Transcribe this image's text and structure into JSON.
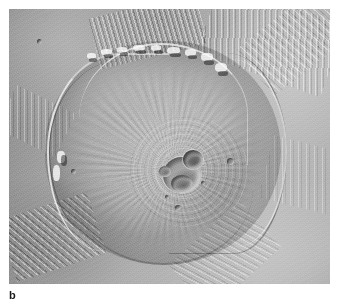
{
  "figure": {
    "panel_label": "b",
    "image_type": "grayscale orbital photograph",
    "colors": {
      "page_background": "#ffffff",
      "plains_mid_gray": "#b8b8b8",
      "flank_gray": "#a0a0a0",
      "shadow_dark": "#5c5c5c",
      "scarp_highlight": "#e8e8e8",
      "caption_text": "#1a1a1a"
    },
    "features": [
      {
        "name": "summit-caldera-complex",
        "description": "overlapping nested collapse craters at the summit"
      },
      {
        "name": "basal-escarpment",
        "description": "bright sunlit cliff ringing the western and northern base"
      },
      {
        "name": "radial-flank-ridges",
        "description": "fine radial lava flow fabric on the shield flanks"
      },
      {
        "name": "grooved-aureole-terrain",
        "description": "furrowed deposits on the surrounding plains"
      }
    ],
    "plate": {
      "left": 9,
      "top": 9,
      "width": 321,
      "height": 275
    }
  }
}
